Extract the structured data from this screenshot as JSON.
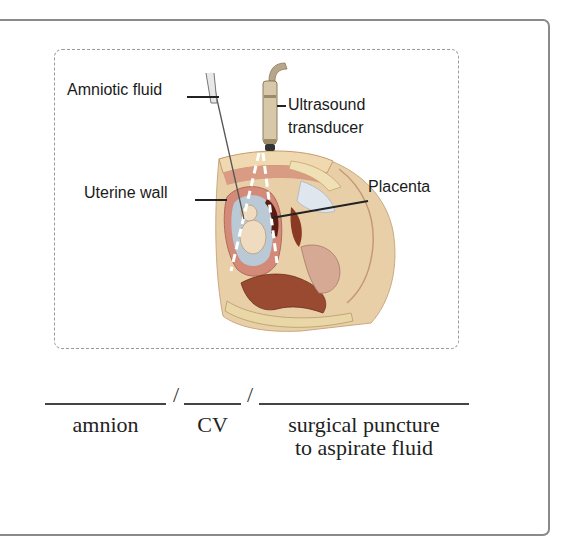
{
  "figure": {
    "labels": {
      "amniotic_fluid": "Amniotic fluid",
      "ultrasound_line1": "Ultrasound",
      "ultrasound_line2": "transducer",
      "uterine_wall": "Uterine wall",
      "placenta": "Placenta"
    },
    "colors": {
      "skin": "#e8cfa8",
      "tissue": "#d9a48c",
      "organ": "#8a3a22",
      "fluid": "#b9c9d6",
      "instrument": "#b8a68a"
    }
  },
  "exercise": {
    "blanks": [
      {
        "separator_after": "/",
        "meaning": "amnion"
      },
      {
        "separator_after": "/",
        "meaning": "CV"
      },
      {
        "separator_after": "",
        "meaning_line1": "surgical puncture",
        "meaning_line2": "to aspirate fluid"
      }
    ]
  }
}
